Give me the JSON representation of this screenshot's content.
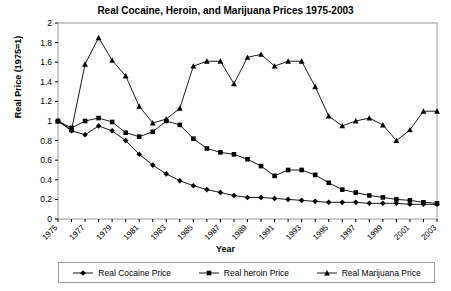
{
  "chart_data": {
    "type": "line",
    "title": "Real Cocaine, Heroin, and Marijuana Prices 1975-2003",
    "xlabel": "Year",
    "ylabel": "Real Price (1975=1)",
    "ylim": [
      0,
      2
    ],
    "xlim": [
      1975,
      2003
    ],
    "grid": false,
    "legend_position": "bottom",
    "ytick_labels": [
      "0",
      "0.2",
      "0.4",
      "0.6",
      "0.8",
      "1",
      "1.2",
      "1.4",
      "1.6",
      "1.8",
      "2"
    ],
    "ytick_values": [
      0,
      0.2,
      0.4,
      0.6,
      0.8,
      1,
      1.2,
      1.4,
      1.6,
      1.8,
      2
    ],
    "x": [
      1975,
      1976,
      1977,
      1978,
      1979,
      1980,
      1981,
      1982,
      1983,
      1984,
      1985,
      1986,
      1987,
      1988,
      1989,
      1990,
      1991,
      1992,
      1993,
      1994,
      1995,
      1996,
      1997,
      1998,
      1999,
      2000,
      2001,
      2002,
      2003
    ],
    "xtick_labels": [
      "1975",
      "1977",
      "1979",
      "1981",
      "1983",
      "1985",
      "1987",
      "1989",
      "1991",
      "1993",
      "1995",
      "1997",
      "1999",
      "2001",
      "2003"
    ],
    "xtick_values": [
      1975,
      1977,
      1979,
      1981,
      1983,
      1985,
      1987,
      1989,
      1991,
      1993,
      1995,
      1997,
      1999,
      2001,
      2003
    ],
    "series": [
      {
        "name": "Real Cocaine Price",
        "marker": "diamond",
        "color": "#000000",
        "values": [
          1.0,
          0.9,
          0.86,
          0.95,
          0.9,
          0.8,
          0.66,
          0.55,
          0.46,
          0.39,
          0.34,
          0.3,
          0.27,
          0.24,
          0.22,
          0.22,
          0.21,
          0.2,
          0.19,
          0.18,
          0.17,
          0.17,
          0.17,
          0.16,
          0.16,
          0.16,
          0.15,
          0.15,
          0.15
        ]
      },
      {
        "name": "Real heroin Price",
        "marker": "square",
        "color": "#000000",
        "values": [
          1.0,
          0.93,
          1.0,
          1.03,
          0.99,
          0.88,
          0.84,
          0.89,
          1.0,
          0.96,
          0.82,
          0.72,
          0.68,
          0.66,
          0.61,
          0.54,
          0.44,
          0.5,
          0.5,
          0.45,
          0.37,
          0.3,
          0.27,
          0.24,
          0.22,
          0.2,
          0.19,
          0.17,
          0.16
        ]
      },
      {
        "name": "Real Marijuana Price",
        "marker": "triangle",
        "color": "#000000",
        "values": [
          1.0,
          0.91,
          1.58,
          1.85,
          1.62,
          1.46,
          1.15,
          0.98,
          1.02,
          1.13,
          1.56,
          1.61,
          1.61,
          1.38,
          1.65,
          1.68,
          1.56,
          1.61,
          1.61,
          1.35,
          1.05,
          0.95,
          1.0,
          1.03,
          0.96,
          0.8,
          0.91,
          1.1,
          1.1
        ]
      }
    ]
  },
  "legend": {
    "items": [
      {
        "label": "Real Cocaine Price",
        "marker": "diamond"
      },
      {
        "label": "Real heroin Price",
        "marker": "square"
      },
      {
        "label": "Real Marijuana Price",
        "marker": "triangle"
      }
    ]
  }
}
